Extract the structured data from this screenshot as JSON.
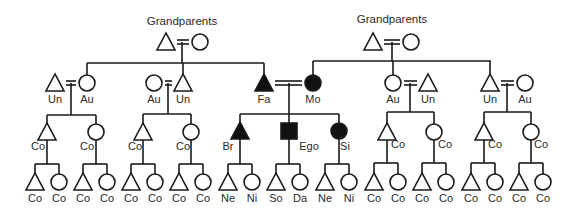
{
  "diagram": {
    "type": "kinship-chart",
    "grandparent_labels": [
      "Grandparents",
      "Grandparents"
    ],
    "colors": {
      "line": "#1a1a1a",
      "filled": "#111111",
      "text": "#2a2a2a",
      "background": "#ffffff"
    },
    "legend_symbols": {
      "triangle": "male",
      "circle": "female",
      "square": "ego",
      "double-line": "marriage",
      "filled": "direct lineal relatives of ego"
    },
    "nodes": [
      {
        "id": "gp-l-m",
        "shape": "triangle",
        "x": 166,
        "y": 42,
        "label": ""
      },
      {
        "id": "gp-l-f",
        "shape": "circle",
        "x": 200,
        "y": 42,
        "label": ""
      },
      {
        "id": "gp-r-m",
        "shape": "triangle",
        "x": 373,
        "y": 42,
        "label": ""
      },
      {
        "id": "gp-r-f",
        "shape": "circle",
        "x": 411,
        "y": 42,
        "label": ""
      },
      {
        "id": "g2-1",
        "shape": "triangle",
        "x": 55,
        "y": 83,
        "label": "Un"
      },
      {
        "id": "g2-2",
        "shape": "circle",
        "x": 87,
        "y": 83,
        "label": "Au"
      },
      {
        "id": "g2-3",
        "shape": "circle",
        "x": 154,
        "y": 83,
        "label": "Au"
      },
      {
        "id": "g2-4",
        "shape": "triangle",
        "x": 183,
        "y": 83,
        "label": "Un"
      },
      {
        "id": "g2-fa",
        "shape": "triangle",
        "x": 264,
        "y": 83,
        "label": "Fa",
        "filled": true
      },
      {
        "id": "g2-mo",
        "shape": "circle",
        "x": 313,
        "y": 83,
        "label": "Mo",
        "filled": true
      },
      {
        "id": "g2-5",
        "shape": "circle",
        "x": 393,
        "y": 83,
        "label": "Au"
      },
      {
        "id": "g2-6",
        "shape": "triangle",
        "x": 428,
        "y": 83,
        "label": "Un"
      },
      {
        "id": "g2-7",
        "shape": "triangle",
        "x": 490,
        "y": 83,
        "label": "Un"
      },
      {
        "id": "g2-8",
        "shape": "circle",
        "x": 525,
        "y": 83,
        "label": "Au"
      },
      {
        "id": "g3-1",
        "shape": "triangle",
        "x": 47,
        "y": 132,
        "label": "Co",
        "lx": 38,
        "ly": 150
      },
      {
        "id": "g3-2",
        "shape": "circle",
        "x": 96,
        "y": 132,
        "label": "Co",
        "lx": 87,
        "ly": 150
      },
      {
        "id": "g3-3",
        "shape": "triangle",
        "x": 143,
        "y": 132,
        "label": "Co",
        "lx": 135,
        "ly": 150
      },
      {
        "id": "g3-4",
        "shape": "circle",
        "x": 191,
        "y": 132,
        "label": "Co",
        "lx": 183,
        "ly": 150
      },
      {
        "id": "g3-br",
        "shape": "triangle",
        "x": 240,
        "y": 131,
        "label": "Br",
        "filled": true,
        "lx": 228,
        "ly": 150
      },
      {
        "id": "g3-ego",
        "shape": "square",
        "x": 289,
        "y": 131,
        "label": "Ego",
        "filled": true,
        "lx": 309,
        "ly": 150
      },
      {
        "id": "g3-si",
        "shape": "circle",
        "x": 339,
        "y": 131,
        "label": "Si",
        "filled": true,
        "lx": 345,
        "ly": 150
      },
      {
        "id": "g3-5",
        "shape": "triangle",
        "x": 387,
        "y": 132,
        "label": "Co",
        "lx": 398,
        "ly": 148
      },
      {
        "id": "g3-6",
        "shape": "circle",
        "x": 434,
        "y": 132,
        "label": "Co",
        "lx": 445,
        "ly": 148
      },
      {
        "id": "g3-7",
        "shape": "triangle",
        "x": 484,
        "y": 132,
        "label": "Co",
        "lx": 495,
        "ly": 148
      },
      {
        "id": "g3-8",
        "shape": "circle",
        "x": 531,
        "y": 132,
        "label": "Co",
        "lx": 541,
        "ly": 148
      },
      {
        "id": "g4-1",
        "shape": "triangle",
        "x": 35,
        "y": 182,
        "label": "Co"
      },
      {
        "id": "g4-2",
        "shape": "circle",
        "x": 59,
        "y": 182,
        "label": "Co"
      },
      {
        "id": "g4-3",
        "shape": "triangle",
        "x": 83,
        "y": 182,
        "label": "Co"
      },
      {
        "id": "g4-4",
        "shape": "circle",
        "x": 107,
        "y": 182,
        "label": "Co"
      },
      {
        "id": "g4-5",
        "shape": "triangle",
        "x": 131,
        "y": 182,
        "label": "Co"
      },
      {
        "id": "g4-6",
        "shape": "circle",
        "x": 155,
        "y": 182,
        "label": "Co"
      },
      {
        "id": "g4-7",
        "shape": "triangle",
        "x": 179,
        "y": 182,
        "label": "Co"
      },
      {
        "id": "g4-8",
        "shape": "circle",
        "x": 203,
        "y": 182,
        "label": "Co"
      },
      {
        "id": "g4-9",
        "shape": "triangle",
        "x": 228,
        "y": 182,
        "label": "Ne"
      },
      {
        "id": "g4-10",
        "shape": "circle",
        "x": 252,
        "y": 182,
        "label": "Ni"
      },
      {
        "id": "g4-11",
        "shape": "triangle",
        "x": 276,
        "y": 182,
        "label": "So"
      },
      {
        "id": "g4-12",
        "shape": "circle",
        "x": 300,
        "y": 182,
        "label": "Da"
      },
      {
        "id": "g4-13",
        "shape": "triangle",
        "x": 325,
        "y": 182,
        "label": "Ne"
      },
      {
        "id": "g4-14",
        "shape": "circle",
        "x": 349,
        "y": 182,
        "label": "Ni"
      },
      {
        "id": "g4-15",
        "shape": "triangle",
        "x": 374,
        "y": 182,
        "label": "Co"
      },
      {
        "id": "g4-16",
        "shape": "circle",
        "x": 398,
        "y": 182,
        "label": "Co"
      },
      {
        "id": "g4-17",
        "shape": "triangle",
        "x": 422,
        "y": 182,
        "label": "Co"
      },
      {
        "id": "g4-18",
        "shape": "circle",
        "x": 446,
        "y": 182,
        "label": "Co"
      },
      {
        "id": "g4-19",
        "shape": "triangle",
        "x": 471,
        "y": 182,
        "label": "Co"
      },
      {
        "id": "g4-20",
        "shape": "circle",
        "x": 495,
        "y": 182,
        "label": "Co"
      },
      {
        "id": "g4-21",
        "shape": "triangle",
        "x": 519,
        "y": 182,
        "label": "Co"
      },
      {
        "id": "g4-22",
        "shape": "circle",
        "x": 543,
        "y": 182,
        "label": "Co"
      }
    ],
    "marriages": [
      {
        "a": "gp-l-m",
        "b": "gp-l-f"
      },
      {
        "a": "gp-r-m",
        "b": "gp-r-f"
      },
      {
        "a": "g2-1",
        "b": "g2-2"
      },
      {
        "a": "g2-3",
        "b": "g2-4"
      },
      {
        "a": "g2-fa",
        "b": "g2-mo"
      },
      {
        "a": "g2-5",
        "b": "g2-6"
      },
      {
        "a": "g2-7",
        "b": "g2-8"
      }
    ]
  }
}
